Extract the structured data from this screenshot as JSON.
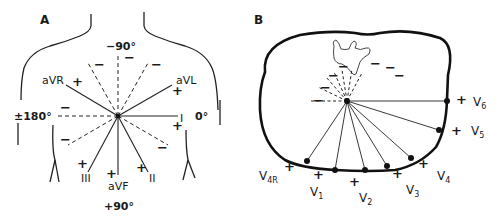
{
  "panel_a": {
    "label": "A",
    "title": "Frontal plane limb leads (hexaxial reference system)",
    "angles": {
      "top": "−90°",
      "left": "±180°",
      "right": "0°",
      "bottom": "+90°"
    },
    "leads": [
      {
        "name": "aVR",
        "positive_sign": "+"
      },
      {
        "name": "aVL",
        "positive_sign": "+"
      },
      {
        "name": "I",
        "positive_sign": "+"
      },
      {
        "name": "II",
        "positive_sign": "+"
      },
      {
        "name": "aVF",
        "positive_sign": "+"
      },
      {
        "name": "III",
        "positive_sign": "+"
      }
    ],
    "negative_sign": "−"
  },
  "panel_b": {
    "label": "B",
    "title": "Horizontal plane precordial leads",
    "leads": [
      {
        "name": "V",
        "sub": "4R"
      },
      {
        "name": "V",
        "sub": "1"
      },
      {
        "name": "V",
        "sub": "2"
      },
      {
        "name": "V",
        "sub": "3"
      },
      {
        "name": "V",
        "sub": "4"
      },
      {
        "name": "V",
        "sub": "5"
      },
      {
        "name": "V",
        "sub": "6"
      }
    ],
    "positive_sign": "+",
    "negative_sign": "−"
  }
}
